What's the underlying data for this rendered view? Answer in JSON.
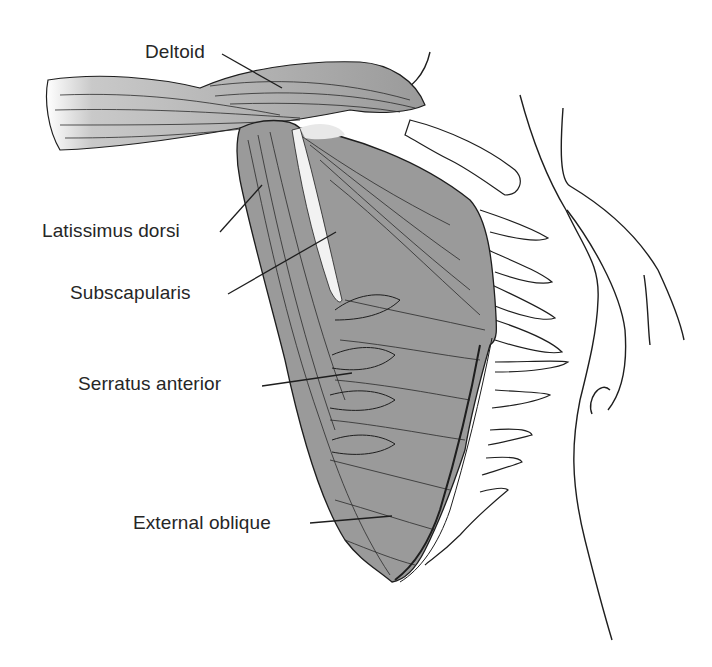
{
  "figure": {
    "colors": {
      "muscle_fill": "#9a9a9a",
      "muscle_light": "#c4c4c4",
      "outline": "#1e1e1e",
      "label_text": "#262626",
      "background": "#ffffff"
    }
  },
  "labels": [
    {
      "id": "deltoid",
      "text": "Deltoid",
      "x": 145,
      "y": 42,
      "leader": [
        [
          222,
          54
        ],
        [
          282,
          88
        ]
      ]
    },
    {
      "id": "latissimus-dorsi",
      "text": "Latissimus dorsi",
      "x": 42,
      "y": 221,
      "leader": [
        [
          220,
          232
        ],
        [
          262,
          185
        ]
      ]
    },
    {
      "id": "subscapularis",
      "text": "Subscapularis",
      "x": 70,
      "y": 283,
      "leader": [
        [
          228,
          294
        ],
        [
          336,
          232
        ]
      ]
    },
    {
      "id": "serratus-anterior",
      "text": "Serratus anterior",
      "x": 78,
      "y": 374,
      "leader": [
        [
          262,
          386
        ],
        [
          352,
          373
        ]
      ]
    },
    {
      "id": "external-oblique",
      "text": "External oblique",
      "x": 133,
      "y": 513,
      "leader": [
        [
          310,
          523
        ],
        [
          392,
          516
        ]
      ]
    }
  ]
}
